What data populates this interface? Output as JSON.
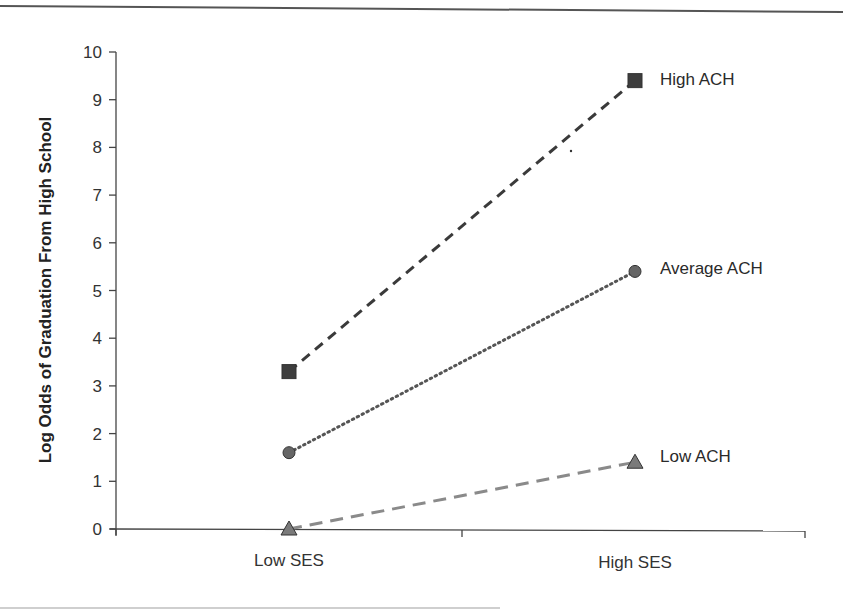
{
  "chart_data": {
    "type": "line",
    "title": "",
    "xlabel": "",
    "ylabel": "Log Odds of Graduation From High School",
    "categories": [
      "Low SES",
      "High SES"
    ],
    "ylim": [
      0,
      10
    ],
    "yticks": [
      0,
      1,
      2,
      3,
      4,
      5,
      6,
      7,
      8,
      9,
      10
    ],
    "grid": false,
    "legend_position": "inline-right",
    "series": [
      {
        "name": "High ACH",
        "values": [
          3.3,
          9.4
        ],
        "marker": "square",
        "line_style": "dashed",
        "color": "#3a3a3a",
        "marker_color": "#3d3d3d"
      },
      {
        "name": "Average ACH",
        "values": [
          1.6,
          5.4
        ],
        "marker": "circle",
        "line_style": "dotted",
        "color": "#555555",
        "marker_color": "#666666"
      },
      {
        "name": "Low ACH",
        "values": [
          0.0,
          1.4
        ],
        "marker": "triangle",
        "line_style": "dashed",
        "color": "#8a8a8a",
        "marker_color": "#7a7a7a"
      }
    ]
  },
  "labels": {
    "ylabel": "Log Odds of Graduation From High School",
    "cat_low": "Low SES",
    "cat_high": "High SES",
    "series_high": "High ACH",
    "series_avg": "Average ACH",
    "series_low": "Low ACH",
    "ytick_0": "0",
    "ytick_1": "1",
    "ytick_2": "2",
    "ytick_3": "3",
    "ytick_4": "4",
    "ytick_5": "5",
    "ytick_6": "6",
    "ytick_7": "7",
    "ytick_8": "8",
    "ytick_9": "9",
    "ytick_10": "10"
  }
}
